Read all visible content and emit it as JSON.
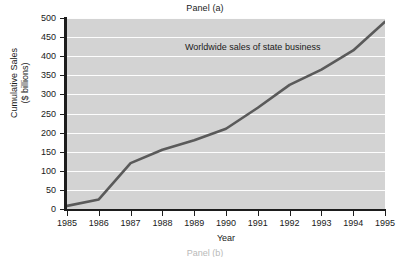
{
  "figure": {
    "panel_title": "Panel (a)",
    "next_panel_title": "Panel (b)",
    "plot_background_color": "#d3d3d3",
    "gridline_color": "#ffffff",
    "line_color": "#5a5a5a",
    "axis_color": "#1d1d1d"
  },
  "chart_data": {
    "type": "line",
    "title": "Panel (a)",
    "xlabel": "Year",
    "ylabel": "Cumulative Sales ($ billions)",
    "ylabel_line1": "Cumulative Sales",
    "ylabel_line2": "($ billions)",
    "annotation": "Worldwide sales of state business",
    "grid": true,
    "grid_axis": "y",
    "legend": "none",
    "xlim": [
      1985,
      1995
    ],
    "ylim": [
      0,
      500
    ],
    "ytick_step": 50,
    "categories": [
      1985,
      1986,
      1987,
      1988,
      1989,
      1990,
      1991,
      1992,
      1993,
      1994,
      1995
    ],
    "x": [
      "1985",
      "1986",
      "1987",
      "1988",
      "1989",
      "1990",
      "1991",
      "1992",
      "1993",
      "1994",
      "1995"
    ],
    "yticks": [
      0,
      50,
      100,
      150,
      200,
      250,
      300,
      350,
      400,
      450,
      500
    ],
    "series": [
      {
        "name": "Worldwide sales of state business",
        "values": [
          8,
          25,
          120,
          155,
          180,
          210,
          265,
          325,
          365,
          415,
          490
        ]
      }
    ]
  }
}
